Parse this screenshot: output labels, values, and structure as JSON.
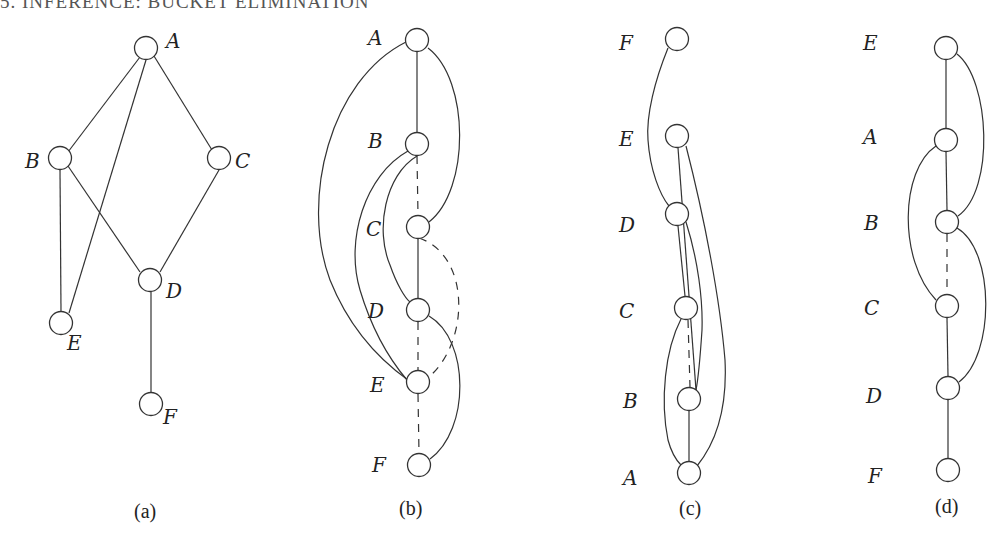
{
  "header": {
    "text": "5. INFERENCE: BUCKET ELIMINATION"
  },
  "panels": [
    {
      "caption": "(a)",
      "nodes": [
        {
          "id": "A",
          "label": "A"
        },
        {
          "id": "B",
          "label": "B"
        },
        {
          "id": "C",
          "label": "C"
        },
        {
          "id": "D",
          "label": "D"
        },
        {
          "id": "E",
          "label": "E"
        },
        {
          "id": "F",
          "label": "F"
        }
      ],
      "edges": [
        {
          "from": "A",
          "to": "B",
          "style": "solid"
        },
        {
          "from": "A",
          "to": "C",
          "style": "solid"
        },
        {
          "from": "A",
          "to": "E",
          "style": "solid"
        },
        {
          "from": "B",
          "to": "E",
          "style": "solid"
        },
        {
          "from": "B",
          "to": "D",
          "style": "solid"
        },
        {
          "from": "C",
          "to": "D",
          "style": "solid"
        },
        {
          "from": "D",
          "to": "F",
          "style": "solid"
        }
      ]
    },
    {
      "caption": "(b)",
      "ordering": [
        "A",
        "B",
        "C",
        "D",
        "E",
        "F"
      ],
      "nodes": [
        {
          "id": "A",
          "label": "A"
        },
        {
          "id": "B",
          "label": "B"
        },
        {
          "id": "C",
          "label": "C"
        },
        {
          "id": "D",
          "label": "D"
        },
        {
          "id": "E",
          "label": "E"
        },
        {
          "id": "F",
          "label": "F"
        }
      ],
      "edges": [
        {
          "from": "A",
          "to": "B",
          "style": "solid"
        },
        {
          "from": "A",
          "to": "C",
          "style": "solid"
        },
        {
          "from": "A",
          "to": "E",
          "style": "solid"
        },
        {
          "from": "B",
          "to": "C",
          "style": "dashed"
        },
        {
          "from": "B",
          "to": "D",
          "style": "solid"
        },
        {
          "from": "B",
          "to": "E",
          "style": "solid"
        },
        {
          "from": "C",
          "to": "D",
          "style": "solid"
        },
        {
          "from": "C",
          "to": "E",
          "style": "dashed"
        },
        {
          "from": "D",
          "to": "E",
          "style": "dashed"
        },
        {
          "from": "D",
          "to": "F",
          "style": "solid"
        },
        {
          "from": "E",
          "to": "F",
          "style": "dashed"
        }
      ]
    },
    {
      "caption": "(c)",
      "ordering": [
        "F",
        "E",
        "D",
        "C",
        "B",
        "A"
      ],
      "nodes": [
        {
          "id": "F",
          "label": "F"
        },
        {
          "id": "E",
          "label": "E"
        },
        {
          "id": "D",
          "label": "D"
        },
        {
          "id": "C",
          "label": "C"
        },
        {
          "id": "B",
          "label": "B"
        },
        {
          "id": "A",
          "label": "A"
        }
      ],
      "edges": [
        {
          "from": "F",
          "to": "D",
          "style": "solid"
        },
        {
          "from": "E",
          "to": "B",
          "style": "solid"
        },
        {
          "from": "E",
          "to": "A",
          "style": "solid"
        },
        {
          "from": "D",
          "to": "C",
          "style": "solid"
        },
        {
          "from": "D",
          "to": "B",
          "style": "solid"
        },
        {
          "from": "C",
          "to": "B",
          "style": "dashed"
        },
        {
          "from": "C",
          "to": "A",
          "style": "solid"
        },
        {
          "from": "B",
          "to": "A",
          "style": "solid"
        }
      ]
    },
    {
      "caption": "(d)",
      "ordering": [
        "E",
        "A",
        "B",
        "C",
        "D",
        "F"
      ],
      "nodes": [
        {
          "id": "E",
          "label": "E"
        },
        {
          "id": "A",
          "label": "A"
        },
        {
          "id": "B",
          "label": "B"
        },
        {
          "id": "C",
          "label": "C"
        },
        {
          "id": "D",
          "label": "D"
        },
        {
          "id": "F",
          "label": "F"
        }
      ],
      "edges": [
        {
          "from": "E",
          "to": "A",
          "style": "solid"
        },
        {
          "from": "E",
          "to": "B",
          "style": "solid"
        },
        {
          "from": "A",
          "to": "B",
          "style": "solid"
        },
        {
          "from": "A",
          "to": "C",
          "style": "solid"
        },
        {
          "from": "B",
          "to": "C",
          "style": "dashed"
        },
        {
          "from": "B",
          "to": "D",
          "style": "solid"
        },
        {
          "from": "C",
          "to": "D",
          "style": "solid"
        },
        {
          "from": "D",
          "to": "F",
          "style": "solid"
        }
      ]
    }
  ]
}
